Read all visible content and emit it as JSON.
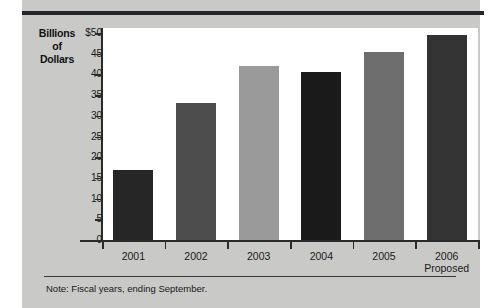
{
  "figure": {
    "y_axis_title_lines": [
      "Billions",
      "of",
      "Dollars"
    ],
    "note": "Note: Fiscal years, ending September."
  },
  "chart_data": {
    "type": "bar",
    "title": "",
    "xlabel": "",
    "ylabel": "Billions of Dollars",
    "categories": [
      "2001",
      "2002",
      "2003",
      "2004",
      "2005",
      "2006"
    ],
    "category_sublabels": [
      "",
      "",
      "",
      "",
      "",
      "Proposed"
    ],
    "values": [
      17,
      33,
      42,
      40.5,
      45.5,
      49.5
    ],
    "bar_colors": [
      "#262626",
      "#4d4d4d",
      "#9a9a9a",
      "#1a1a1a",
      "#6e6e6e",
      "#333333"
    ],
    "ylim": [
      0,
      50
    ],
    "ytick_labels": [
      "$50",
      "45",
      "40",
      "35",
      "30",
      "25",
      "20",
      "15",
      "10",
      "5",
      "0"
    ],
    "ytick_values": [
      50,
      45,
      40,
      35,
      30,
      25,
      20,
      15,
      10,
      5,
      0
    ],
    "grid": false,
    "legend": "none",
    "annotations": [
      "Note: Fiscal years, ending September."
    ]
  }
}
